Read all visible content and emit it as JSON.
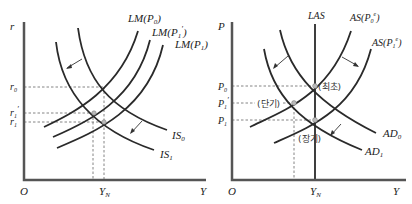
{
  "left_panel": {
    "y_axis_label": "r",
    "x_axis_label": "Y",
    "origin_label": "O",
    "x_tick": "Y_N",
    "y_ticks": [
      "r0",
      "r1'",
      "r1"
    ],
    "curves": [
      "LM(P0)",
      "LM(P1')",
      "LM(P1)",
      "IS0",
      "IS1"
    ],
    "labels": {
      "lm0": "LM(P",
      "lm0_sub": "0",
      "lm1p": "LM(P",
      "lm1p_sub": "1",
      "lm1": "LM(P",
      "lm1_sub": "1",
      "is0": "IS",
      "is0_sub": "0",
      "is1": "IS",
      "is1_sub": "1",
      "r": "r",
      "r0": "r",
      "r0_sub": "0",
      "r1p": "r",
      "r1p_sub": "1",
      "r1": "r",
      "r1_sub": "1",
      "O": "O",
      "YN": "Y",
      "YN_sub": "N",
      "Y": "Y"
    }
  },
  "right_panel": {
    "y_axis_label": "P",
    "x_axis_label": "Y",
    "origin_label": "O",
    "x_tick": "Y_N",
    "y_ticks": [
      "P0",
      "P1'",
      "P1"
    ],
    "curves": [
      "LAS",
      "AS(P0e)",
      "AS(P1e)",
      "AD0",
      "AD1"
    ],
    "annotations": [
      "(최초)",
      "(단기)",
      "(장기)"
    ],
    "labels": {
      "las": "LAS",
      "as0": "AS(P",
      "as0_sub": "0",
      "as1": "AS(P",
      "as1_sub": "1",
      "ad0": "AD",
      "ad0_sub": "0",
      "ad1": "AD",
      "ad1_sub": "1",
      "P": "P",
      "p0": "P",
      "p0_sub": "0",
      "p1p": "P",
      "p1p_sub": "1",
      "p1": "P",
      "p1_sub": "1",
      "O": "O",
      "YN": "Y",
      "YN_sub": "N",
      "Y": "Y",
      "initial": "(최초)",
      "short_run": "(단기)",
      "long_run": "(장기)"
    }
  }
}
